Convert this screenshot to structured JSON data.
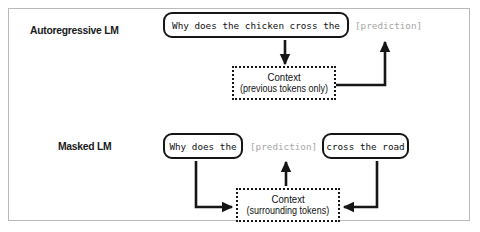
{
  "figure": {
    "rows": [
      {
        "id": "autoregressive",
        "label": "Autoregressive LM",
        "token_boxes": [
          {
            "text": "Why does the chicken cross the"
          }
        ],
        "prediction": "[prediction]",
        "context": {
          "title": "Context",
          "subtitle": "(previous tokens only)"
        }
      },
      {
        "id": "masked",
        "label": "Masked LM",
        "token_boxes": [
          {
            "text": "Why does the"
          },
          {
            "text": "cross the road"
          }
        ],
        "prediction": "[prediction]",
        "context": {
          "title": "Context",
          "subtitle": "(surrounding tokens)"
        }
      }
    ],
    "colors": {
      "frame_border": "#b9b9b9",
      "box_border": "#161616",
      "text": "#111111",
      "prediction_text": "#a6a6a6",
      "arrow": "#161616",
      "background": "#ffffff"
    }
  }
}
